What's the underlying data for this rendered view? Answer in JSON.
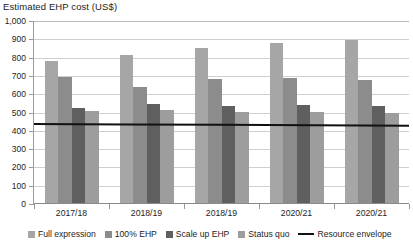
{
  "chart_data": {
    "type": "bar",
    "title": "Estimated EHP cost (US$)",
    "xlabel": "",
    "ylabel": "",
    "ylim": [
      0,
      1000
    ],
    "ytick_step": 100,
    "ytick_labels": [
      "1,000",
      "900",
      "800",
      "700",
      "600",
      "500",
      "400",
      "300",
      "200",
      "100",
      "0"
    ],
    "grid": true,
    "legend_position": "bottom",
    "categories": [
      "2017/18",
      "2018/19",
      "2018/19",
      "2020/21",
      "2020/21"
    ],
    "series": [
      {
        "name": "Full expression",
        "color": "#a6a6a6",
        "values": [
          780,
          815,
          850,
          880,
          895
        ]
      },
      {
        "name": "100% EHP",
        "color": "#8c8c8c",
        "values": [
          695,
          640,
          685,
          688,
          678
        ]
      },
      {
        "name": "Scale up EHP",
        "color": "#5f5f5f",
        "values": [
          525,
          545,
          535,
          540,
          535
        ]
      },
      {
        "name": "Status quo",
        "color": "#9d9d9d",
        "values": [
          510,
          515,
          505,
          505,
          500
        ]
      }
    ],
    "overlay_line": {
      "name": "Resource envelope",
      "color": "#111111",
      "values": [
        437,
        435,
        433,
        431,
        428
      ]
    }
  },
  "legend": {
    "items": [
      {
        "label": "Full expression",
        "type": "swatch",
        "color": "#a6a6a6"
      },
      {
        "label": "100% EHP",
        "type": "swatch",
        "color": "#8c8c8c"
      },
      {
        "label": "Scale up EHP",
        "type": "swatch",
        "color": "#5f5f5f"
      },
      {
        "label": "Status quo",
        "type": "swatch",
        "color": "#9d9d9d"
      },
      {
        "label": "Resource envelope",
        "type": "line",
        "color": "#111111"
      }
    ]
  }
}
